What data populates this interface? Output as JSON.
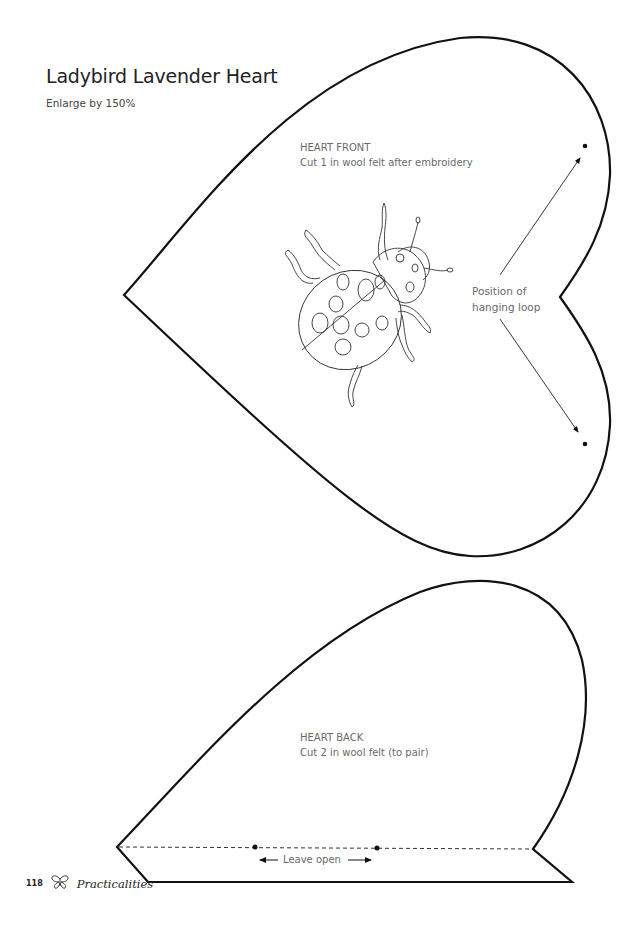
{
  "header": {
    "title": "Ladybird Lavender Heart",
    "subtitle": "Enlarge by 150%"
  },
  "heart_front": {
    "heading": "HEART FRONT",
    "instruction": "Cut 1 in wool felt after embroidery",
    "embroidery_motif": "ladybird-icon",
    "loop_label_line1": "Position of",
    "loop_label_line2": "hanging loop"
  },
  "heart_back": {
    "heading": "HEART BACK",
    "instruction": "Cut 2 in wool felt (to pair)",
    "opening_label": "Leave open"
  },
  "footer": {
    "page_number": "118",
    "icon": "butterfly-icon",
    "section": "Practicalities"
  },
  "colors": {
    "outline": "#111111",
    "label_text": "#6a6a6a",
    "title_text": "#222222"
  }
}
